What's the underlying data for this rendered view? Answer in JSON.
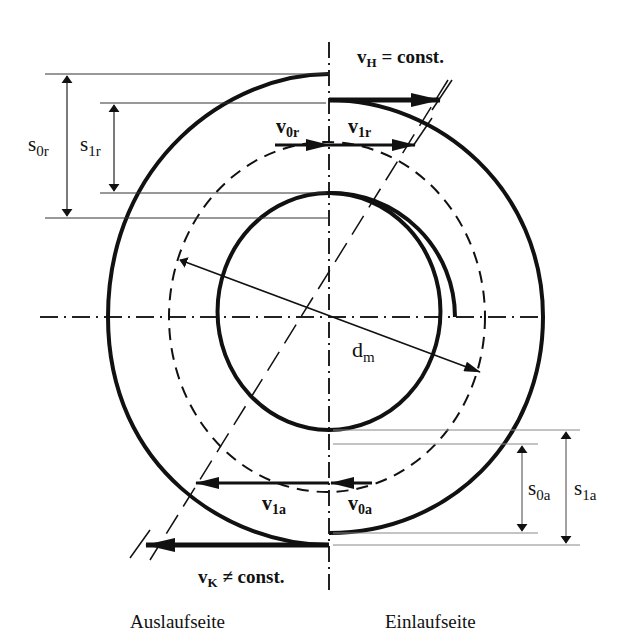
{
  "diagram": {
    "title_top": "vH = const.",
    "top_label": {
      "main": "v",
      "sub": "H",
      "rest": " = const."
    },
    "bottom_label": {
      "main": "v",
      "sub": "K",
      "rest": " ≠ const."
    },
    "velocities": {
      "v0r": {
        "main": "v",
        "sub": "0r"
      },
      "v1r": {
        "main": "v",
        "sub": "1r"
      },
      "v0a": {
        "main": "v",
        "sub": "0a"
      },
      "v1a": {
        "main": "v",
        "sub": "1a"
      }
    },
    "dimensions": {
      "s0r": {
        "main": "s",
        "sub": "0r"
      },
      "s1r": {
        "main": "s",
        "sub": "1r"
      },
      "s0a": {
        "main": "s",
        "sub": "0a"
      },
      "s1a": {
        "main": "s",
        "sub": "1a"
      },
      "dm": {
        "main": "d",
        "sub": "m"
      }
    },
    "sides": {
      "left": "Auslaufseite",
      "right": "Einlaufseite"
    },
    "colors": {
      "stroke": "#111111",
      "thin": "#333333",
      "background": "#ffffff"
    }
  }
}
